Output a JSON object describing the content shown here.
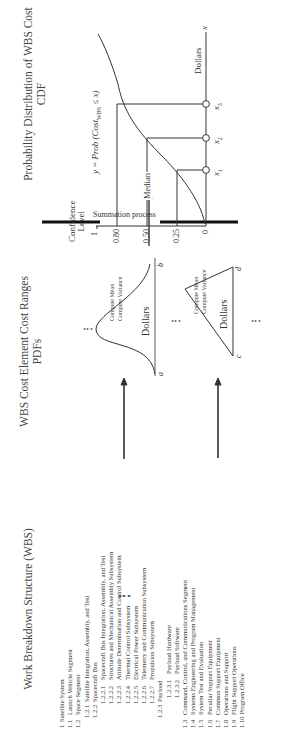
{
  "wbs": {
    "title": "Work Breakdown Structure (WBS)",
    "items": [
      {
        "num": "1",
        "label": "Satellite System",
        "level": 0
      },
      {
        "num": "1.1",
        "label": "Launch Vehicle Segment",
        "level": 0
      },
      {
        "num": "1.2",
        "label": "Space Segment",
        "level": 0
      },
      {
        "num": "1.2.1",
        "label": "Satellite Integration, Assembly, and Test",
        "level": 1
      },
      {
        "num": "1.2.2",
        "label": "Spacecraft Bus",
        "level": 1
      },
      {
        "num": "1.2.2.1",
        "label": "Spacecraft Bus Integration, Assembly, and Test",
        "level": 2
      },
      {
        "num": "1.2.2.2",
        "label": "Structures and Mechanical Assembly Subsystem",
        "level": 2
      },
      {
        "num": "1.2.2.3",
        "label": "Attitude Determination and Control Subsystem",
        "level": 2
      },
      {
        "num": "1.2.2.4",
        "label": "Thermal Control Subsystem",
        "level": 2
      },
      {
        "num": "1.2.2.5",
        "label": "Electrical Power Subsystem",
        "level": 2
      },
      {
        "num": "1.2.2.6",
        "label": "Telemetry and Communication Subsystem",
        "level": 2
      },
      {
        "num": "1.2.2.7",
        "label": "Propulsion Subsystem",
        "level": 2
      },
      {
        "num": "1.2.3",
        "label": "Payload",
        "level": 1
      },
      {
        "num": "1.2.3.1",
        "label": "Payload Hardware",
        "level": 3
      },
      {
        "num": "1.2.3.2",
        "label": "Payload Software",
        "level": 3
      },
      {
        "num": "1.3",
        "label": "Command, Control, and Communications Segment",
        "level": 0
      },
      {
        "num": "1.4",
        "label": "Systems Engineering and Program Management",
        "level": 0
      },
      {
        "num": "1.5",
        "label": "System Test and Evaluation",
        "level": 0
      },
      {
        "num": "1.6",
        "label": "Peculiar Support Equipment",
        "level": 0
      },
      {
        "num": "1.7",
        "label": "Common Support Equipment",
        "level": 0
      },
      {
        "num": "1.8",
        "label": "Operations and Support",
        "level": 0
      },
      {
        "num": "1.9",
        "label": "Flight Support Operations",
        "level": 0
      },
      {
        "num": "1.10",
        "label": "Program Office",
        "level": 0
      }
    ],
    "continuation": "⋮"
  },
  "pdfs": {
    "title_line1": "WBS Cost Element Cost Ranges",
    "title_line2": "PDFs",
    "normal": {
      "compute_mean": "Compute Mean",
      "compute_variance": "Compute Variance",
      "axis_label": "Dollars",
      "lower": "a",
      "upper": "b"
    },
    "triangular": {
      "compute_mean": "Compute Mean",
      "compute_variance": "Compute Variance",
      "axis_label": "Dollars",
      "lower": "c",
      "upper": "d"
    },
    "ellipsis": "⋮",
    "ellipsis_h": "…"
  },
  "summation": {
    "label": "Summation process"
  },
  "cdf": {
    "title_line1": "Probability Distribution of WBS Cost",
    "title_line2": "CDF",
    "y_axis_title_line1": "Confidence",
    "y_axis_title_line2": "Level",
    "y_ticks": [
      "1",
      "0.80",
      "0.50",
      "0.25",
      "0"
    ],
    "median_label": "Median",
    "equation": "y = Prob (Cost",
    "equation_sub": "WBS",
    "equation_tail": " ≤ x)",
    "x_axis_label": "Dollars",
    "x_axis_var": "x",
    "x_points": [
      "x1",
      "x2",
      "x3"
    ]
  }
}
